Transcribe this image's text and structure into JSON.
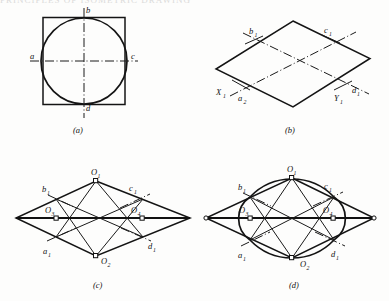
{
  "page": {
    "header_fragment": "PRINCIPLES OF ISOMETRIC DRAWING",
    "background_color": "#fdfdfc",
    "ink_color": "#111111"
  },
  "figure": {
    "panels": [
      {
        "key": "a",
        "caption": "(a)",
        "description": "true circle inscribed in a square with centre lines",
        "labels": [
          {
            "text": "a",
            "sub": "",
            "position": "left"
          },
          {
            "text": "b",
            "sub": "",
            "position": "top"
          },
          {
            "text": "c",
            "sub": "",
            "position": "right"
          },
          {
            "text": "d",
            "sub": "",
            "position": "bottom"
          }
        ]
      },
      {
        "key": "b",
        "caption": "(b)",
        "description": "isometric rhombus of the enclosing square with isometric axes",
        "labels": [
          {
            "text": "b",
            "sub": "1",
            "position": "upper-left"
          },
          {
            "text": "c",
            "sub": "1",
            "position": "upper-right"
          },
          {
            "text": "X",
            "sub": "1",
            "position": "lower-left-outer"
          },
          {
            "text": "a",
            "sub": "2",
            "position": "lower-left"
          },
          {
            "text": "Y",
            "sub": "1",
            "position": "lower-right"
          },
          {
            "text": "d",
            "sub": "1",
            "position": "lower-right-outer"
          }
        ]
      },
      {
        "key": "c",
        "caption": "(c)",
        "description": "construction lines from obtuse corners to midpoints locating the four arc centres",
        "labels": [
          {
            "text": "O",
            "sub": "1",
            "position": "top-vertex"
          },
          {
            "text": "O",
            "sub": "2",
            "position": "bottom-vertex"
          },
          {
            "text": "O",
            "sub": "3",
            "position": "left-centre"
          },
          {
            "text": "O",
            "sub": "4",
            "position": "right-centre"
          },
          {
            "text": "b",
            "sub": "1",
            "position": "upper-left"
          },
          {
            "text": "c",
            "sub": "1",
            "position": "upper-right"
          },
          {
            "text": "a",
            "sub": "1",
            "position": "lower-left"
          },
          {
            "text": "d",
            "sub": "1",
            "position": "lower-right"
          }
        ]
      },
      {
        "key": "d",
        "caption": "(d)",
        "description": "completed four-centre approximate ellipse inscribed in the isometric rhombus",
        "labels": [
          {
            "text": "O",
            "sub": "1",
            "position": "top-vertex"
          },
          {
            "text": "O",
            "sub": "2",
            "position": "bottom-vertex"
          },
          {
            "text": "O",
            "sub": "3",
            "position": "left-centre"
          },
          {
            "text": "O",
            "sub": "4",
            "position": "right-centre"
          },
          {
            "text": "b",
            "sub": "1",
            "position": "upper-left"
          },
          {
            "text": "c",
            "sub": "1",
            "position": "upper-right"
          },
          {
            "text": "a",
            "sub": "1",
            "position": "lower-left"
          },
          {
            "text": "d",
            "sub": "1",
            "position": "lower-right"
          }
        ]
      }
    ]
  }
}
